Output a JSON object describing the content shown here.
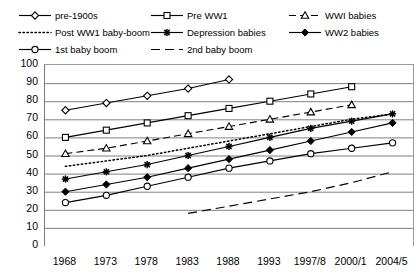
{
  "chart_data": {
    "type": "line",
    "title": "",
    "xlabel": "",
    "ylabel": "",
    "ylim": [
      0,
      100
    ],
    "ytick_step": 10,
    "yticks": [
      100,
      90,
      80,
      70,
      60,
      50,
      40,
      30,
      20,
      10,
      0
    ],
    "grid": true,
    "grid_axis": "y",
    "legend_position": "top",
    "categories": [
      "1968",
      "1973",
      "1978",
      "1983",
      "1988",
      "1993",
      "1997/8",
      "2000/1",
      "2004/5"
    ],
    "series": [
      {
        "name": "pre-1900s",
        "marker": "diamond-open",
        "line": "solid",
        "values": [
          75,
          79,
          83,
          87,
          92,
          null,
          null,
          null,
          null
        ]
      },
      {
        "name": "Pre WW1",
        "marker": "square-open",
        "line": "solid",
        "values": [
          60,
          64,
          68,
          72,
          76,
          80,
          84,
          88,
          null
        ]
      },
      {
        "name": "WWI babies",
        "marker": "triangle-open",
        "line": "dashed",
        "values": [
          51,
          54,
          58,
          62,
          66,
          70,
          74,
          78,
          null
        ]
      },
      {
        "name": "Post WW1 baby-boom",
        "marker": "none",
        "line": "dotted",
        "values": [
          44,
          47,
          50,
          54,
          58,
          62,
          66,
          70,
          73
        ]
      },
      {
        "name": "Depression babies",
        "marker": "star",
        "line": "solid",
        "values": [
          37,
          41,
          45,
          50,
          55,
          60,
          65,
          69,
          73
        ]
      },
      {
        "name": "WW2 babies",
        "marker": "diamond-filled",
        "line": "solid",
        "values": [
          30,
          34,
          38,
          43,
          48,
          53,
          58,
          63,
          68
        ]
      },
      {
        "name": "1st baby boom",
        "marker": "circle-open",
        "line": "solid",
        "values": [
          24,
          28,
          33,
          38,
          43,
          47,
          51,
          54,
          57
        ]
      },
      {
        "name": "2nd baby boom",
        "marker": "none",
        "line": "dashed-long",
        "values": [
          null,
          null,
          null,
          18,
          22,
          26,
          30,
          35,
          41
        ]
      }
    ]
  },
  "legend": {
    "items": [
      {
        "label": "pre-1900s",
        "marker": "diamond-open",
        "line": "solid",
        "col": 0,
        "row": 0
      },
      {
        "label": "Pre WW1",
        "marker": "square-open",
        "line": "solid",
        "col": 1,
        "row": 0
      },
      {
        "label": "WWI babies",
        "marker": "triangle-open",
        "line": "dashed",
        "col": 2,
        "row": 0
      },
      {
        "label": "Post WW1 baby-boom",
        "marker": "none",
        "line": "dotted",
        "col": 0,
        "row": 1
      },
      {
        "label": "Depression babies",
        "marker": "star",
        "line": "solid",
        "col": 1,
        "row": 1
      },
      {
        "label": "WW2 babies",
        "marker": "diamond-filled",
        "line": "solid",
        "col": 2,
        "row": 1
      },
      {
        "label": "1st baby boom",
        "marker": "circle-open",
        "line": "solid",
        "col": 0,
        "row": 2
      },
      {
        "label": "2nd baby boom",
        "marker": "none",
        "line": "dashed-long",
        "col": 1,
        "row": 2
      }
    ]
  },
  "colors": {
    "series_line": "#000000",
    "grid": "#808080",
    "axis": "#7b7b7b",
    "background": "#ffffff",
    "text": "#000000"
  }
}
